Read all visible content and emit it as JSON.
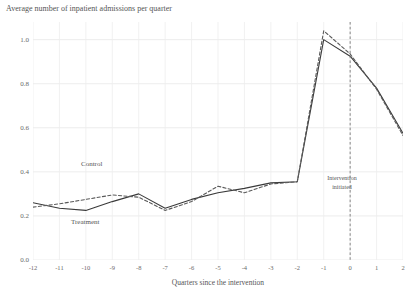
{
  "chart_data": {
    "type": "line",
    "title": "Average number of inpatient admissions per quarter",
    "xlabel": "Quarters since the intervention",
    "ylabel": "",
    "x": [
      -12,
      -11,
      -10,
      -9,
      -8,
      -7,
      -6,
      -5,
      -4,
      -3,
      -2,
      -1,
      0,
      1,
      2
    ],
    "xtick_labels": [
      "-12",
      "-11",
      "-10",
      "-9",
      "-8",
      "-7",
      "-6",
      "-5",
      "-4",
      "-3",
      "-2",
      "-1",
      "0",
      "1",
      "2"
    ],
    "ytick_labels": [
      "0.0",
      "0.2",
      "0.4",
      "0.6",
      "0.8",
      "1.0"
    ],
    "yticks": [
      0.0,
      0.2,
      0.4,
      0.6,
      0.8,
      1.0
    ],
    "xlim": [
      -12,
      2
    ],
    "ylim": [
      0.0,
      1.08
    ],
    "grid": true,
    "legend_position": "inline-labels",
    "series": [
      {
        "name": "Treatment",
        "style": "solid",
        "color": "#3a3a3a",
        "values": [
          0.26,
          0.235,
          0.225,
          0.265,
          0.3,
          0.235,
          0.275,
          0.305,
          0.325,
          0.35,
          0.355,
          1.0,
          0.925,
          0.78,
          0.575
        ]
      },
      {
        "name": "Control",
        "style": "dashed",
        "color": "#5a5a5a",
        "values": [
          0.24,
          0.255,
          0.275,
          0.295,
          0.285,
          0.225,
          0.265,
          0.335,
          0.305,
          0.345,
          0.355,
          1.04,
          0.935,
          0.775,
          0.565
        ]
      }
    ],
    "annotations": [
      {
        "name": "intervention-marker",
        "x": 0,
        "line_style": "dashed",
        "color": "#7a7a7a",
        "text_line1": "Intervention",
        "text_line2": "initiated"
      }
    ]
  }
}
